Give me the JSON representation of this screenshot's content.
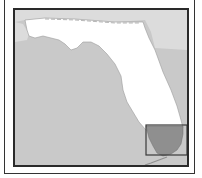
{
  "map": {
    "subject": "Florida locator map",
    "highlighted_region": "South Florida",
    "colors": {
      "water": "#c9c9c9",
      "neighbor_land": "#dcdcdc",
      "state_land": "#ffffff",
      "highlight": "#8f8f8f",
      "frame": "#2a2a2a",
      "inset_box": "#3a3a3a"
    },
    "inset_box": {
      "x": 131,
      "y": 115,
      "width": 41,
      "height": 30
    }
  }
}
